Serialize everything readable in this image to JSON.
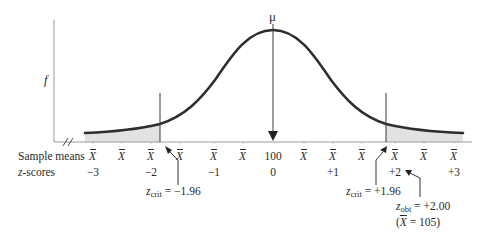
{
  "figure": {
    "mu_label": "μ",
    "y_axis_label": "f",
    "row_labels": {
      "sample_means": "Sample means",
      "z_scores_prefix": "z",
      "z_scores_suffix": "-scores"
    },
    "sample_means": [
      {
        "text": "X",
        "is_xbar": true
      },
      {
        "text": "X",
        "is_xbar": true
      },
      {
        "text": "X",
        "is_xbar": true
      },
      {
        "text": "X",
        "is_xbar": true
      },
      {
        "text": "X",
        "is_xbar": true
      },
      {
        "text": "X",
        "is_xbar": true
      },
      {
        "text": "100",
        "is_xbar": false
      },
      {
        "text": "X",
        "is_xbar": true
      },
      {
        "text": "X",
        "is_xbar": true
      },
      {
        "text": "X",
        "is_xbar": true
      },
      {
        "text": "X",
        "is_xbar": true
      },
      {
        "text": "X",
        "is_xbar": true
      },
      {
        "text": "X",
        "is_xbar": true
      }
    ],
    "z_scores": [
      "−3",
      "−2",
      "−1",
      "0",
      "+1",
      "+2",
      "+3"
    ],
    "annotations": {
      "z_crit_left": {
        "var": "z",
        "sub": "crit",
        "value": "= −1.96"
      },
      "z_crit_right": {
        "var": "z",
        "sub": "crit",
        "value": "= +1.96"
      },
      "z_obt": {
        "var": "z",
        "sub": "obt",
        "value": "= +2.00"
      },
      "x_obt": {
        "open": "(",
        "var": "X",
        "value": " = 105)"
      }
    },
    "colors": {
      "curve": "#2e2e2e",
      "shade": "#e2e2e2",
      "axis": "#8a8a8a",
      "text": "#2a2a2a"
    }
  }
}
